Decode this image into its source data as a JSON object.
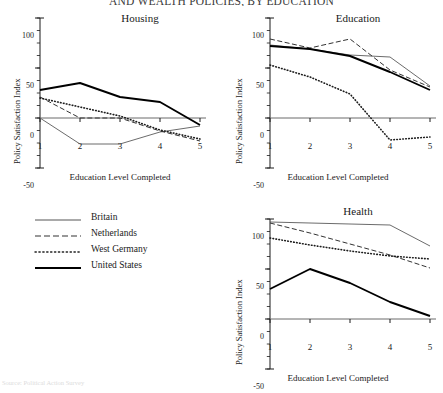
{
  "figure": {
    "title": "AND WEALTH POLICIES, BY EDUCATION",
    "footnote": "Source: Political Action Survey"
  },
  "axes": {
    "ylabel": "Policy Satisfaction Index",
    "xlabel": "Education Level Completed",
    "yticks": [
      "100",
      "50",
      "0",
      "-50"
    ],
    "xticks": [
      "1",
      "2",
      "3",
      "4",
      "5"
    ]
  },
  "legend": {
    "items": [
      {
        "label": "Britain",
        "style": "solid-thin",
        "color": "#555555"
      },
      {
        "label": "Netherlands",
        "style": "dashed",
        "color": "#333333"
      },
      {
        "label": "West Germany",
        "style": "dotted",
        "color": "#222222"
      },
      {
        "label": "United States",
        "style": "solid-thick",
        "color": "#000000"
      }
    ]
  },
  "chart_data": [
    {
      "type": "line",
      "title": "Housing",
      "xlabel": "Education Level Completed",
      "ylabel": "Policy Satisfaction Index",
      "categories": [
        "1",
        "2",
        "3",
        "4",
        "5"
      ],
      "ylim": [
        -50,
        100
      ],
      "yticks": [
        -50,
        0,
        50,
        100
      ],
      "grid": false,
      "legend_position": "external-lower-left",
      "series": [
        {
          "name": "Britain",
          "style": "solid-thin",
          "values": [
            0,
            -26,
            -26,
            -14,
            -8
          ]
        },
        {
          "name": "Netherlands",
          "style": "dashed",
          "values": [
            21,
            0,
            0,
            -13,
            -23
          ]
        },
        {
          "name": "West Germany",
          "style": "dotted",
          "values": [
            20,
            11,
            2,
            -12,
            -21
          ]
        },
        {
          "name": "United States",
          "style": "solid-thick",
          "values": [
            28,
            35,
            21,
            16,
            -7
          ]
        }
      ]
    },
    {
      "type": "line",
      "title": "Education",
      "xlabel": "Education Level Completed",
      "ylabel": "Policy Satisfaction Index",
      "categories": [
        "1",
        "2",
        "3",
        "4",
        "5"
      ],
      "ylim": [
        -50,
        100
      ],
      "yticks": [
        -50,
        0,
        50,
        100
      ],
      "grid": false,
      "legend_position": "external-lower-left",
      "series": [
        {
          "name": "Britain",
          "style": "solid-thin",
          "values": [
            73,
            69,
            63,
            61,
            32
          ]
        },
        {
          "name": "Netherlands",
          "style": "dashed",
          "values": [
            79,
            70,
            79,
            48,
            31
          ]
        },
        {
          "name": "West Germany",
          "style": "dotted",
          "values": [
            53,
            41,
            24,
            -22,
            -19
          ]
        },
        {
          "name": "United States",
          "style": "solid-thick",
          "values": [
            72,
            69,
            62,
            46,
            28
          ]
        }
      ]
    },
    {
      "type": "line",
      "title": "Health",
      "xlabel": "Education Level Completed",
      "ylabel": "Policy Satisfaction Index",
      "categories": [
        "1",
        "2",
        "3",
        "4",
        "5"
      ],
      "ylim": [
        -50,
        100
      ],
      "yticks": [
        -50,
        0,
        50,
        100
      ],
      "grid": false,
      "legend_position": "external-lower-left",
      "series": [
        {
          "name": "Britain",
          "style": "solid-thin",
          "values": [
            97,
            96,
            95,
            94,
            73
          ]
        },
        {
          "name": "Netherlands",
          "style": "dashed",
          "values": [
            96,
            86,
            75,
            64,
            51
          ]
        },
        {
          "name": "West Germany",
          "style": "dotted",
          "values": [
            81,
            74,
            68,
            63,
            60
          ]
        },
        {
          "name": "United States",
          "style": "solid-thick",
          "values": [
            30,
            50,
            36,
            17,
            3
          ]
        }
      ]
    }
  ]
}
